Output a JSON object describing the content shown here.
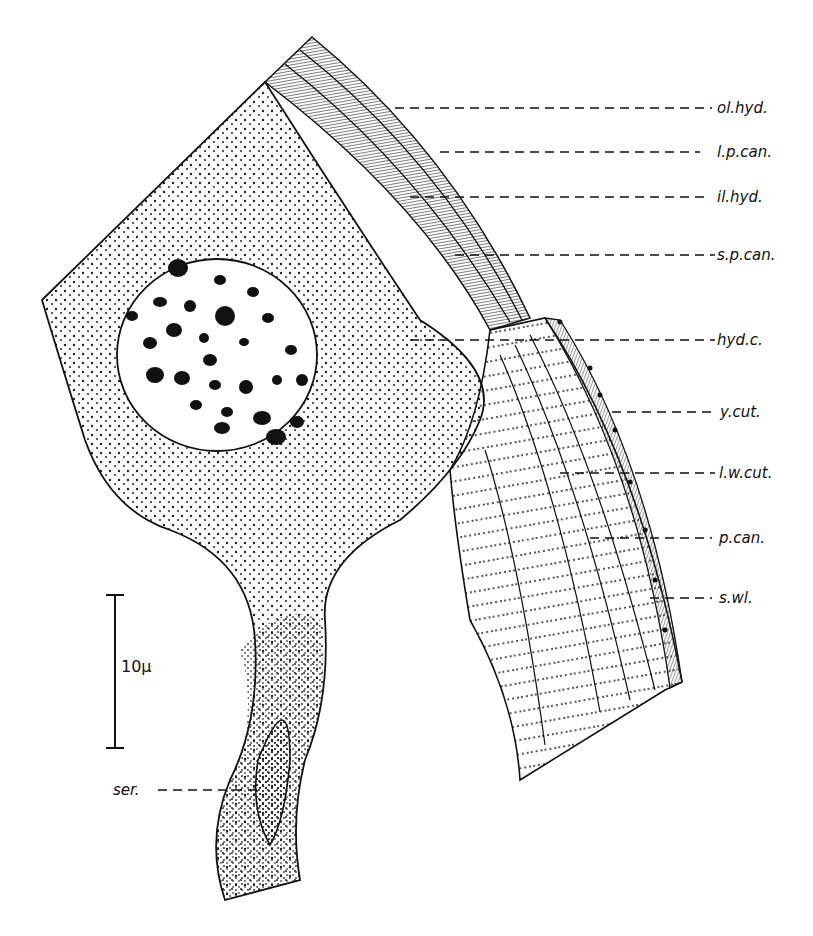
{
  "labels": {
    "ol_hyd": "ol.hyd.",
    "l_p_can": "l.p.can.",
    "il_hyd": "il.hyd.",
    "s_p_can": "s.p.can.",
    "hyd_c": "hyd.c.",
    "y_cut": "y.cut.",
    "l_w_cut": "l.w.cut.",
    "p_can": "p.can.",
    "s_wl": "s.wl.",
    "ser": "ser."
  },
  "scale_bar": {
    "label": "10μ"
  }
}
